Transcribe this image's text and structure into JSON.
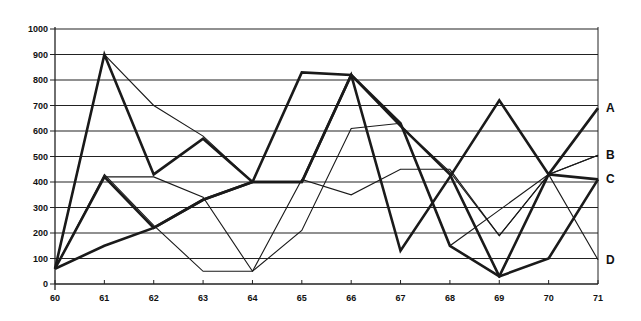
{
  "chart_data": {
    "type": "line",
    "title": "",
    "xlabel": "",
    "ylabel": "",
    "x": [
      60,
      61,
      62,
      63,
      64,
      65,
      66,
      67,
      68,
      69,
      70,
      71
    ],
    "x_tick_labels": [
      "60",
      "61",
      "62",
      "63",
      "64",
      "65",
      "66",
      "67",
      "68",
      "69",
      "70",
      "71"
    ],
    "y_tick_labels": [
      "0",
      "100",
      "200",
      "300",
      "400",
      "500",
      "600",
      "700",
      "800",
      "900",
      "1000"
    ],
    "ylim": [
      0,
      1000
    ],
    "grid": "horizontal",
    "legend_position": "right-end-labels",
    "series": [
      {
        "name": "A",
        "weight": "thick",
        "values": [
          60,
          900,
          430,
          570,
          400,
          400,
          820,
          130,
          420,
          720,
          430,
          690
        ]
      },
      {
        "name": "B",
        "weight": "thin",
        "values": [
          60,
          900,
          700,
          580,
          400,
          400,
          820,
          620,
          440,
          190,
          430,
          505
        ]
      },
      {
        "name": "C",
        "weight": "thick",
        "values": [
          60,
          150,
          220,
          330,
          400,
          830,
          820,
          620,
          430,
          30,
          100,
          410
        ]
      },
      {
        "name": "D",
        "weight": "thin",
        "values": [
          60,
          420,
          420,
          340,
          50,
          210,
          610,
          630,
          150,
          290,
          430,
          95
        ]
      },
      {
        "name": "",
        "weight": "thick",
        "values": [
          60,
          420,
          220,
          330,
          400,
          400,
          820,
          630,
          150,
          30,
          430,
          410
        ]
      },
      {
        "name": "",
        "weight": "thin",
        "values": [
          60,
          430,
          230,
          50,
          50,
          410,
          350,
          450,
          450,
          190,
          430,
          505
        ]
      }
    ]
  }
}
